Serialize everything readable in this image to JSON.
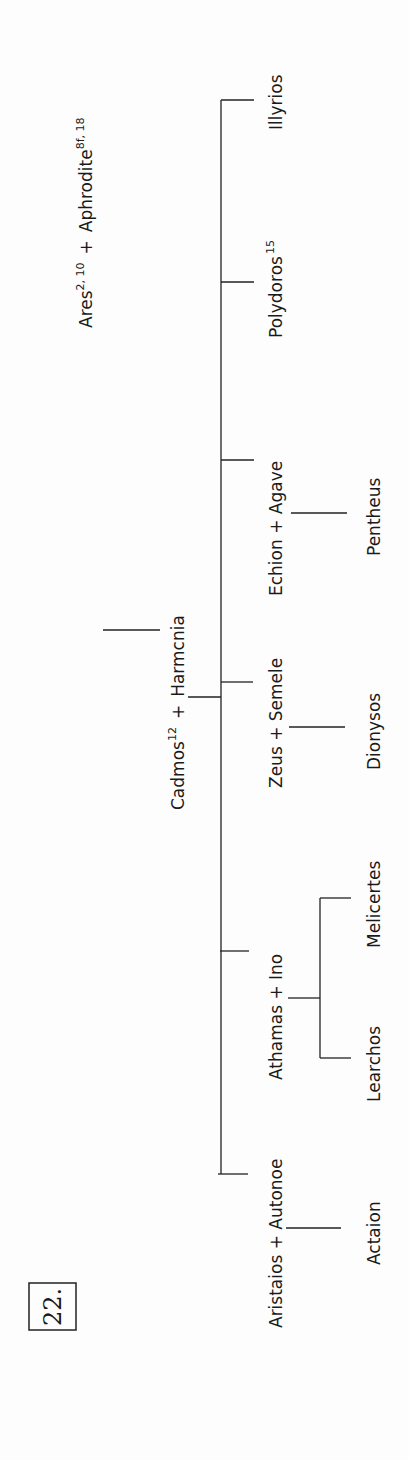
{
  "figure": {
    "number": "22.",
    "root": {
      "name_1": "Ares",
      "sup_1": "2, 10",
      "plus": "+",
      "name_2": "Aphrodite",
      "sup_2": "8f, 18"
    },
    "couple": {
      "name_1": "Cadmos",
      "sup_1": "12",
      "plus": "+",
      "name_2": "Harmcnia"
    },
    "children": [
      {
        "label": "Aristaios  +  Autonoe"
      },
      {
        "label": "Athamas  +  Ino"
      },
      {
        "label": "Zeus + Semele"
      },
      {
        "label": "Echion  +  Agave"
      },
      {
        "name": "Polydoros",
        "sup": "15"
      },
      {
        "label": "Illyrios"
      }
    ],
    "grandchildren": {
      "aristaios": [
        "Actaion"
      ],
      "athamas": [
        "Learchos",
        "Melicertes"
      ],
      "zeus": [
        "Dionysos"
      ],
      "echion": [
        "Pentheus"
      ]
    }
  }
}
